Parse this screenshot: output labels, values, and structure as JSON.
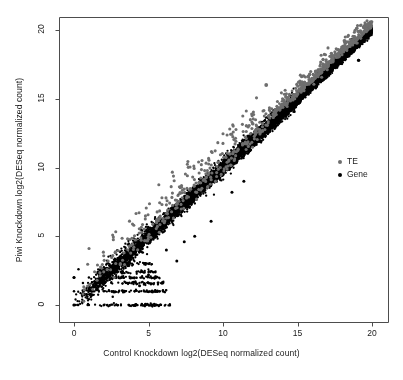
{
  "chart_data": {
    "type": "scatter",
    "title": "",
    "xlabel": "Control Knockdown log2(DESeq normalized count)",
    "ylabel": "Piwi Knockdown log2(DESeq normalized count)",
    "xlim": [
      -0.8,
      20.8
    ],
    "ylim": [
      -0.8,
      21.2
    ],
    "xticks": [
      0,
      5,
      10,
      15,
      20
    ],
    "yticks": [
      0,
      5,
      10,
      15,
      20
    ],
    "xtick_labels": [
      "0",
      "5",
      "10",
      "15",
      "20"
    ],
    "ytick_labels": [
      "0",
      "5",
      "10",
      "15",
      "20"
    ],
    "grid": false,
    "legend_position": "right-middle",
    "series": [
      {
        "name": "Gene",
        "color": "#000000",
        "marker": "filled-circle",
        "marker_size": 2.0,
        "n_points": 6200,
        "description": "Dense diagonal band along y=x, tight correlation, with discrete quantized rows at low counts (y = 0,1,2,3 and x = 0..6).",
        "model": {
          "kind": "diagonal-band",
          "x_range": [
            0,
            20
          ],
          "slope": 1.0,
          "intercept": 0.0,
          "scatter_sd": 0.3,
          "density_peak_x": 6.5,
          "quantized_rows_y": [
            0,
            1,
            1.6,
            2,
            2.4,
            3
          ],
          "quantized_x_range": [
            0,
            6.5
          ]
        }
      },
      {
        "name": "TE",
        "color": "#6e6e6e",
        "marker": "filled-circle",
        "marker_size": 2.6,
        "n_points": 620,
        "description": "Transposable elements, sparser, scattered mostly above the gene diagonal (higher in Piwi knockdown), spread widens at mid counts.",
        "model": {
          "kind": "diagonal-band",
          "x_range": [
            0.5,
            20
          ],
          "slope": 1.0,
          "intercept": 0.55,
          "scatter_sd": 1.05,
          "upper_bias": true
        }
      }
    ],
    "notable_points": [
      {
        "x": 19.9,
        "y": 20.2,
        "series": "TE"
      },
      {
        "x": 19.6,
        "y": 19.9,
        "series": "TE"
      },
      {
        "x": 19.1,
        "y": 17.8,
        "series": "Gene"
      },
      {
        "x": 12.9,
        "y": 16.0,
        "series": "TE"
      },
      {
        "x": 0.0,
        "y": 0.0,
        "series": "Gene"
      },
      {
        "x": 0.0,
        "y": 2.0,
        "series": "Gene"
      }
    ]
  },
  "legend": {
    "entries": [
      {
        "label": "TE",
        "color": "#6e6e6e"
      },
      {
        "label": "Gene",
        "color": "#000000"
      }
    ]
  },
  "axes": {
    "x_title": "Control Knockdown log2(DESeq normalized count)",
    "y_title": "Piwi Knockdown log2(DESeq normalized count)",
    "x_tick_labels": [
      "0",
      "5",
      "10",
      "15",
      "20"
    ],
    "y_tick_labels": [
      "0",
      "5",
      "10",
      "15",
      "20"
    ],
    "frame_color": "#4d4d4d"
  }
}
